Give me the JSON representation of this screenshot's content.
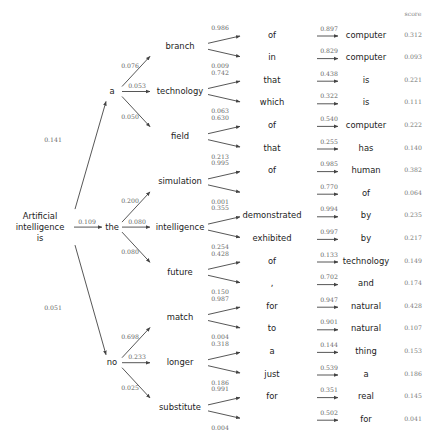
{
  "root": {
    "lines": [
      "Artificial",
      "intelligence",
      "is"
    ]
  },
  "score_header": "score",
  "highlight_color": "#e8956e",
  "level1": [
    {
      "word": "a",
      "prob": "0.141"
    },
    {
      "word": "the",
      "prob": "0.109"
    },
    {
      "word": "no",
      "prob": "0.051"
    }
  ],
  "level2": [
    {
      "parent": 0,
      "word": "branch",
      "prob": "0.076"
    },
    {
      "parent": 0,
      "word": "technology",
      "prob": "0.053"
    },
    {
      "parent": 0,
      "word": "field",
      "prob": "0.050"
    },
    {
      "parent": 1,
      "word": "simulation",
      "prob": "0.200"
    },
    {
      "parent": 1,
      "word": "intelligence",
      "prob": "0.080"
    },
    {
      "parent": 1,
      "word": "future",
      "prob": "0.080"
    },
    {
      "parent": 2,
      "word": "match",
      "prob": "0.698"
    },
    {
      "parent": 2,
      "word": "longer",
      "prob": "0.233"
    },
    {
      "parent": 2,
      "word": "substitute",
      "prob": "0.025"
    }
  ],
  "level3": [
    {
      "parent": 0,
      "word": "of",
      "prob": "0.986"
    },
    {
      "parent": 0,
      "word": "in",
      "prob": "0.009"
    },
    {
      "parent": 1,
      "word": "that",
      "prob": "0.742"
    },
    {
      "parent": 1,
      "word": "which",
      "prob": "0.063"
    },
    {
      "parent": 2,
      "word": "of",
      "prob": "0.630"
    },
    {
      "parent": 2,
      "word": "that",
      "prob": "0.213"
    },
    {
      "parent": 3,
      "word": "of",
      "prob": "0.995"
    },
    {
      "parent": 3,
      "word": "",
      "prob": "0.001"
    },
    {
      "parent": 4,
      "word": "demonstrated",
      "prob": "0.355"
    },
    {
      "parent": 4,
      "word": "exhibited",
      "prob": "0.254"
    },
    {
      "parent": 5,
      "word": "of",
      "prob": "0.428"
    },
    {
      "parent": 5,
      "word": ",",
      "prob": "0.150"
    },
    {
      "parent": 6,
      "word": "for",
      "prob": "0.987"
    },
    {
      "parent": 6,
      "word": "to",
      "prob": "0.004"
    },
    {
      "parent": 7,
      "word": "a",
      "prob": "0.318"
    },
    {
      "parent": 7,
      "word": "just",
      "prob": "0.186"
    },
    {
      "parent": 8,
      "word": "for",
      "prob": "0.991"
    },
    {
      "parent": 8,
      "word": "",
      "prob": "0.004"
    }
  ],
  "level4": [
    {
      "word": "computer",
      "prob": "0.897",
      "score": "0.312",
      "highlight": false
    },
    {
      "word": "computer",
      "prob": "0.829",
      "score": "0.093",
      "highlight": false
    },
    {
      "word": "is",
      "prob": "0.438",
      "score": "0.221",
      "highlight": false
    },
    {
      "word": "is",
      "prob": "0.322",
      "score": "0.111",
      "highlight": false
    },
    {
      "word": "computer",
      "prob": "0.540",
      "score": "0.222",
      "highlight": false
    },
    {
      "word": "has",
      "prob": "0.255",
      "score": "0.140",
      "highlight": false
    },
    {
      "word": "human",
      "prob": "0.985",
      "score": "0.382",
      "highlight": false
    },
    {
      "word": "of",
      "prob": "0.770",
      "score": "0.064",
      "highlight": false
    },
    {
      "word": "by",
      "prob": "0.994",
      "score": "0.235",
      "highlight": false
    },
    {
      "word": "by",
      "prob": "0.997",
      "score": "0.217",
      "highlight": false
    },
    {
      "word": "technology",
      "prob": "0.133",
      "score": "0.149",
      "highlight": false
    },
    {
      "word": "and",
      "prob": "0.702",
      "score": "0.174",
      "highlight": false
    },
    {
      "word": "natural",
      "prob": "0.947",
      "score": "0.428",
      "highlight": true
    },
    {
      "word": "natural",
      "prob": "0.901",
      "score": "0.107",
      "highlight": false
    },
    {
      "word": "thing",
      "prob": "0.144",
      "score": "0.153",
      "highlight": false
    },
    {
      "word": "a",
      "prob": "0.539",
      "score": "0.186",
      "highlight": false
    },
    {
      "word": "real",
      "prob": "0.351",
      "score": "0.145",
      "highlight": false
    },
    {
      "word": "for",
      "prob": "0.502",
      "score": "0.041",
      "highlight": false
    }
  ]
}
